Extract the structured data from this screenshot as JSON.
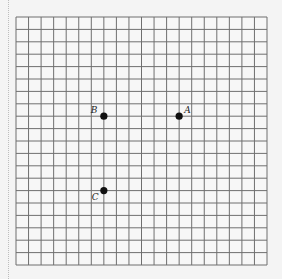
{
  "grid": {
    "columns": 20,
    "rows": 20,
    "origin_x": 16,
    "origin_y": 17,
    "cell_w": 12.55,
    "cell_h": 12.4,
    "line_color": "#6f6f6f",
    "background": "#f4f4f4"
  },
  "points": [
    {
      "label": "A",
      "col": 13,
      "row": 8,
      "label_dx": 5,
      "label_dy": -10
    },
    {
      "label": "B",
      "col": 7,
      "row": 8,
      "label_dx": -13,
      "label_dy": -10
    },
    {
      "label": "C",
      "col": 7,
      "row": 14,
      "label_dx": -12,
      "label_dy": 2
    }
  ],
  "point_color": "#111111"
}
